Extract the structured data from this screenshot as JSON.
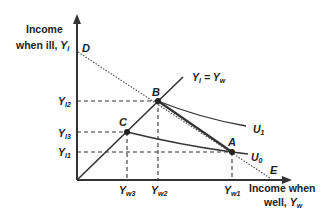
{
  "axes": {
    "y_label_line1": "Income",
    "y_label_line2": "when ill, ",
    "y_label_var": "Y",
    "y_label_sub": "I",
    "x_label_line1": "Income when",
    "x_label_line2": "well, ",
    "x_label_var": "Y",
    "x_label_sub": "w"
  },
  "points": {
    "A": "A",
    "B": "B",
    "C": "C",
    "D": "D",
    "E": "E"
  },
  "ticks": {
    "y": [
      {
        "var": "Y",
        "sub": "I2"
      },
      {
        "var": "Y",
        "sub": "I3"
      },
      {
        "var": "Y",
        "sub": "I1"
      }
    ],
    "x": [
      {
        "var": "Y",
        "sub": "w3"
      },
      {
        "var": "Y",
        "sub": "w2"
      },
      {
        "var": "Y",
        "sub": "w1"
      }
    ]
  },
  "lines": {
    "certainty_line_label": "Y",
    "certainty_line_sub1": "I",
    "certainty_line_eq": " = Y",
    "certainty_line_sub2": "w",
    "u1": "U",
    "u1_sub": "1",
    "u0": "U",
    "u0_sub": "0"
  },
  "colors": {
    "axis": "#333333",
    "line": "#333333",
    "dotted": "#555555"
  }
}
